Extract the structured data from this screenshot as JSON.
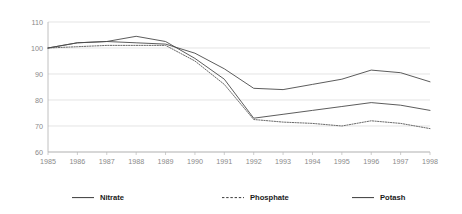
{
  "chart_data": {
    "type": "line",
    "title": "",
    "xlabel": "",
    "ylabel": "",
    "x": [
      1985,
      1986,
      1987,
      1988,
      1989,
      1990,
      1991,
      1992,
      1993,
      1994,
      1995,
      1996,
      1997,
      1998
    ],
    "categories": [
      "1985",
      "1986",
      "1987",
      "1988",
      "1989",
      "1990",
      "1991",
      "1992",
      "1993",
      "1994",
      "1995",
      "1996",
      "1997",
      "1998"
    ],
    "series": [
      {
        "name": "Nitrate",
        "style": "solid",
        "values": [
          100,
          102,
          102.5,
          102,
          101.5,
          98,
          92,
          84.5,
          84,
          86,
          88,
          91.5,
          90.5,
          87
        ]
      },
      {
        "name": "Phosphate",
        "style": "dotted",
        "values": [
          100,
          100.5,
          101,
          101,
          101,
          95,
          86,
          72.5,
          71.5,
          71,
          70,
          72,
          71,
          69
        ]
      },
      {
        "name": "Potash",
        "style": "solid",
        "values": [
          100,
          102,
          102.5,
          104.5,
          102.5,
          96,
          88,
          73,
          74.5,
          76,
          77.5,
          79,
          78,
          76
        ]
      }
    ],
    "ylim": [
      60,
      110
    ],
    "yticks": [
      60,
      70,
      80,
      90,
      100,
      110
    ],
    "ytick_labels": [
      "60",
      "70",
      "80",
      "90",
      "100",
      "110"
    ],
    "xlim": [
      1985,
      1998
    ],
    "grid": "horizontal",
    "legend_position": "bottom",
    "legend": [
      "Nitrate",
      "Phosphate",
      "Potash"
    ],
    "colors": {
      "gridline": "#d9d9d9",
      "axis": "#b0b0b0",
      "tick_text": "#8a8a8a",
      "series_line": "#4a4a4a",
      "legend_text": "#1a1a1a",
      "background": "#ffffff"
    }
  }
}
